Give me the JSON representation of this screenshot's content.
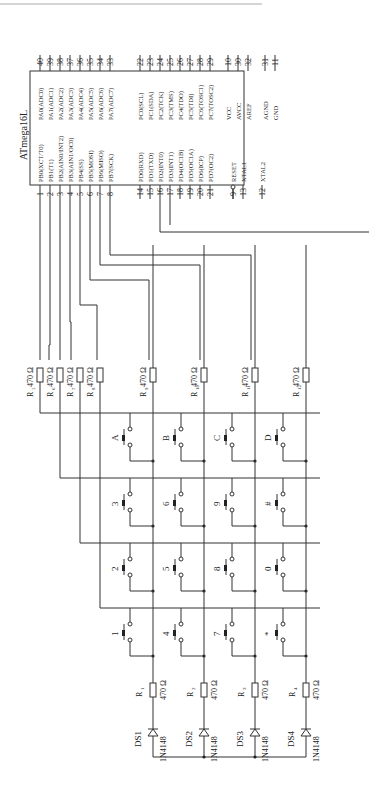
{
  "chip": {
    "name": "ATmega16L",
    "left_pins": [
      {
        "num": "1",
        "label": "PB0(XCT/T0)"
      },
      {
        "num": "2",
        "label": "PB1(T1)"
      },
      {
        "num": "3",
        "label": "PB2(AIN0/INT2)"
      },
      {
        "num": "4",
        "label": "PB3(AIN1/OC0)"
      },
      {
        "num": "5",
        "label": "PB4(SS)"
      },
      {
        "num": "6",
        "label": "PB5(MOSI)"
      },
      {
        "num": "7",
        "label": "PB6(MISO)"
      },
      {
        "num": "8",
        "label": "PB7(SCK)"
      },
      {
        "num": "14",
        "label": "PD0(RXD)"
      },
      {
        "num": "15",
        "label": "PD1(TXD)"
      },
      {
        "num": "16",
        "label": "PD2(INT0)"
      },
      {
        "num": "17",
        "label": "PD3(INT1)"
      },
      {
        "num": "18",
        "label": "PD4(OC1B)"
      },
      {
        "num": "19",
        "label": "PD5(OC1A)"
      },
      {
        "num": "20",
        "label": "PD6(ICP)"
      },
      {
        "num": "21",
        "label": "PD7(OC2)"
      },
      {
        "num": "9",
        "label": "RESET"
      },
      {
        "num": "13",
        "label": "XTAL1"
      },
      {
        "num": "12",
        "label": "XTAL2"
      }
    ],
    "right_pins": [
      {
        "num": "40",
        "label": "PA0(ADC0)"
      },
      {
        "num": "39",
        "label": "PA1(ADC1)"
      },
      {
        "num": "38",
        "label": "PA2(ADC2)"
      },
      {
        "num": "37",
        "label": "PA3(ADC3)"
      },
      {
        "num": "36",
        "label": "PA4(ADC4)"
      },
      {
        "num": "35",
        "label": "PA5(ADC5)"
      },
      {
        "num": "34",
        "label": "PA6(ADC6)"
      },
      {
        "num": "33",
        "label": "PA7(ADC7)"
      },
      {
        "num": "22",
        "label": "PC0(SCL)"
      },
      {
        "num": "23",
        "label": "PC1(SDA)"
      },
      {
        "num": "24",
        "label": "PC2(TCK)"
      },
      {
        "num": "25",
        "label": "PC3(TMS)"
      },
      {
        "num": "26",
        "label": "PC4(TDO)"
      },
      {
        "num": "27",
        "label": "PC5(TDI)"
      },
      {
        "num": "28",
        "label": "PC6(TOSC1)"
      },
      {
        "num": "29",
        "label": "PC7(TOSC2)"
      },
      {
        "num": "10",
        "label": "VCC"
      },
      {
        "num": "30",
        "label": "AVCC"
      },
      {
        "num": "32",
        "label": "AREF"
      },
      {
        "num": "31",
        "label": "AGND"
      },
      {
        "num": "11",
        "label": "GND"
      }
    ]
  },
  "pull_resistors": [
    {
      "name": "R5",
      "sub": "5",
      "value": "470 Ω"
    },
    {
      "name": "R6",
      "sub": "6",
      "value": "470 Ω"
    },
    {
      "name": "R7",
      "sub": "7",
      "value": "470 Ω"
    },
    {
      "name": "R8",
      "sub": "8",
      "value": "470 Ω"
    },
    {
      "name": "R9",
      "sub": "9",
      "value": "470 Ω"
    },
    {
      "name": "R10",
      "sub": "10",
      "value": "470 Ω"
    },
    {
      "name": "R11",
      "sub": "11",
      "value": "470 Ω"
    },
    {
      "name": "R12",
      "sub": "12",
      "value": "470 Ω"
    }
  ],
  "keypad": {
    "rows": [
      [
        "A",
        "B",
        "C",
        "D"
      ],
      [
        "3",
        "6",
        "9",
        "#"
      ],
      [
        "2",
        "5",
        "8",
        "0"
      ],
      [
        "1",
        "4",
        "7",
        "*"
      ]
    ]
  },
  "led_resistors": [
    {
      "name": "R1",
      "sub": "1",
      "value": "470 Ω"
    },
    {
      "name": "R2",
      "sub": "2",
      "value": "470 Ω"
    },
    {
      "name": "R3",
      "sub": "3",
      "value": "470 Ω"
    },
    {
      "name": "R4",
      "sub": "4",
      "value": "470 Ω"
    }
  ],
  "diodes": [
    {
      "ref": "DS1",
      "part": "1N4148"
    },
    {
      "ref": "DS2",
      "part": "1N4148"
    },
    {
      "ref": "DS3",
      "part": "1N4148"
    },
    {
      "ref": "DS4",
      "part": "1N4148"
    }
  ],
  "resistor_letter": "R"
}
